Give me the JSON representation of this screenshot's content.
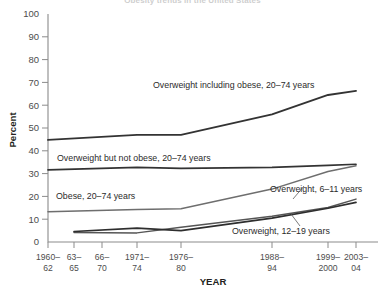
{
  "chart_data": {
    "type": "line",
    "title": "Obesity trends in the United States",
    "xlabel": "YEAR",
    "ylabel": "Percent",
    "ylim": [
      0,
      100
    ],
    "ytick_labels": [
      "0",
      "10",
      "20",
      "30",
      "40",
      "50",
      "60",
      "70",
      "80",
      "90",
      "100"
    ],
    "ytick_values": [
      0,
      10,
      20,
      30,
      40,
      50,
      60,
      70,
      80,
      90,
      100
    ],
    "grid": false,
    "legend_position": "inline-annotations",
    "categories": [
      "1960–62",
      "63–65",
      "66–70",
      "1971–74",
      "1976–80",
      "1988–94",
      "1999–2000",
      "2003–04"
    ],
    "category_lines": [
      [
        "1960–",
        "62"
      ],
      [
        "63–",
        "65"
      ],
      [
        "66–",
        "70"
      ],
      [
        "1971–",
        "74"
      ],
      [
        "1976–",
        "80"
      ],
      [
        "1988–",
        "94"
      ],
      [
        "1999–",
        "2000"
      ],
      [
        "2003–",
        "04"
      ]
    ],
    "series": [
      {
        "name": "Overweight including obese, 20–74 years",
        "color": "#333333",
        "width": 1.9,
        "x": [
          "1960–62",
          "1971–74",
          "1976–80",
          "1988–94",
          "1999–2000",
          "2003–04"
        ],
        "values": [
          44.8,
          47.0,
          47.0,
          56.0,
          64.5,
          66.3
        ]
      },
      {
        "name": "Overweight but not obese, 20–74 years",
        "color": "#333333",
        "width": 1.7,
        "x": [
          "1960–62",
          "1971–74",
          "1976–80",
          "1988–94",
          "1999–2000",
          "2003–04"
        ],
        "values": [
          31.6,
          32.7,
          32.3,
          32.7,
          33.6,
          34.1
        ]
      },
      {
        "name": "Obese, 20–74 years",
        "color": "#6e6e6e",
        "width": 1.5,
        "x": [
          "1960–62",
          "1971–74",
          "1976–80",
          "1988–94",
          "1999–2000",
          "2003–04"
        ],
        "values": [
          13.3,
          14.3,
          14.6,
          23.2,
          30.9,
          33.4
        ]
      },
      {
        "name": "Overweight, 6–11 years",
        "color": "#555555",
        "width": 1.5,
        "x": [
          "63–65",
          "1971–74",
          "1976–80",
          "1988–94",
          "1999–2000",
          "2003–04"
        ],
        "values": [
          4.2,
          4.0,
          6.5,
          11.3,
          15.1,
          18.8
        ]
      },
      {
        "name": "Overweight, 12–19 years",
        "color": "#2e2e2e",
        "width": 1.7,
        "x": [
          "63–65",
          "1971–74",
          "1976–80",
          "1988–94",
          "1999–2000",
          "2003–04"
        ],
        "values": [
          4.6,
          6.1,
          5.0,
          10.5,
          14.8,
          17.4
        ]
      }
    ],
    "annotations": [
      {
        "text": "Overweight including obese, 20–74 years",
        "x": 153,
        "y": 88
      },
      {
        "text": "Overweight but not obese, 20–74 years",
        "x": 57,
        "y": 161
      },
      {
        "text": "Obese, 20–74 years",
        "x": 56,
        "y": 199
      },
      {
        "text": "Overweight, 6–11 years",
        "x": 270,
        "y": 192
      },
      {
        "text": "Overweight, 12–19 years",
        "x": 232,
        "y": 234
      }
    ]
  }
}
